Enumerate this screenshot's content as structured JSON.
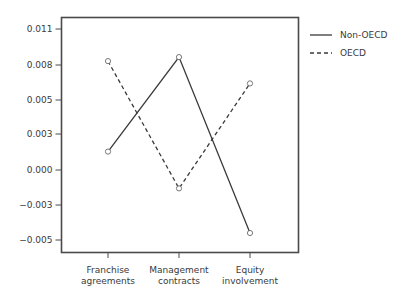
{
  "chart_data": {
    "type": "line",
    "title": "",
    "xlabel": "",
    "ylabel": "",
    "categories": [
      "Franchise agreements",
      "Management contracts",
      "Equity involvement"
    ],
    "category_lines": [
      [
        "Franchise",
        "agreements"
      ],
      [
        "Management",
        "contracts"
      ],
      [
        "Equity",
        "involvement"
      ]
    ],
    "yticks": [
      0.011,
      0.008,
      0.005,
      0.003,
      0.0,
      -0.003,
      -0.005
    ],
    "ytick_labels": [
      "0.011",
      "0.008",
      "0.005",
      "0.003",
      "0.000",
      "-0.003",
      "-0.005"
    ],
    "ylim": [
      -0.0063,
      0.0116
    ],
    "grid": false,
    "legend_position": "right",
    "series": [
      {
        "name": "Non-OECD",
        "style": "solid",
        "color": "#3a3a3a",
        "values": [
          0.0014,
          0.0086,
          -0.0048
        ]
      },
      {
        "name": "OECD",
        "style": "dashed",
        "color": "#3a3a3a",
        "values": [
          0.0083,
          -0.0014,
          0.0066
        ]
      }
    ]
  },
  "legend": {
    "items": [
      {
        "label": "Non-OECD"
      },
      {
        "label": "OECD"
      }
    ]
  }
}
